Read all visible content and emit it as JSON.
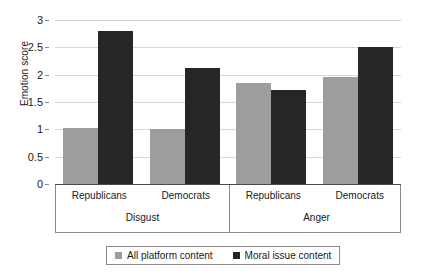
{
  "chart_data": {
    "type": "bar",
    "title": "",
    "xlabel": "",
    "ylabel": "Emotion score",
    "ylim": [
      0,
      3
    ],
    "yticks": [
      "0",
      "0.5",
      "1",
      "1.5",
      "2",
      "2.5",
      "3"
    ],
    "grid": true,
    "legend_position": "bottom",
    "groups": [
      {
        "label": "Disgust",
        "categories": [
          "Republicans",
          "Democrats"
        ]
      },
      {
        "label": "Anger",
        "categories": [
          "Republicans",
          "Democrats"
        ]
      }
    ],
    "categories": [
      "Disgust - Republicans",
      "Disgust - Democrats",
      "Anger - Republicans",
      "Anger - Democrats"
    ],
    "series": [
      {
        "name": "All platform content",
        "color": "#9d9d9d",
        "values": [
          1.03,
          1.0,
          1.85,
          1.95
        ]
      },
      {
        "name": "Moral issue content",
        "color": "#262626",
        "values": [
          2.8,
          2.12,
          1.72,
          2.5
        ]
      }
    ]
  },
  "legend": {
    "items": [
      {
        "label": "All platform content",
        "color": "#9d9d9d"
      },
      {
        "label": "Moral issue content",
        "color": "#262626"
      }
    ]
  }
}
